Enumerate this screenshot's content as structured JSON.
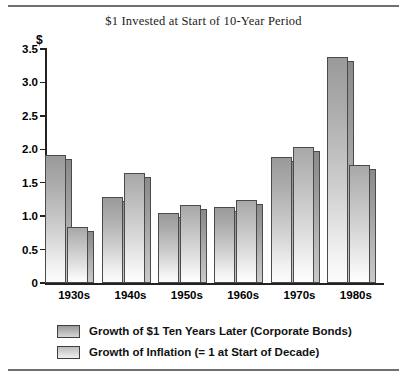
{
  "chart_data": {
    "type": "bar",
    "title": "$1 Invested at Start of 10-Year Period",
    "xlabel": "",
    "ylabel": "$",
    "ylim": [
      0,
      3.5
    ],
    "ytick_labels": [
      "0",
      "0.5",
      "1.0",
      "1.5",
      "2.0",
      "2.5",
      "3.0",
      "3.5"
    ],
    "ytick_values": [
      0,
      0.5,
      1.0,
      1.5,
      2.0,
      2.5,
      3.0,
      3.5
    ],
    "grid": false,
    "legend_position": "bottom-left",
    "categories": [
      "1930s",
      "1940s",
      "1950s",
      "1960s",
      "1970s",
      "1980s"
    ],
    "series": [
      {
        "name": "Growth of $1 Ten Years Later (Corporate Bonds)",
        "values": [
          1.91,
          1.29,
          1.04,
          1.13,
          1.88,
          3.38
        ]
      },
      {
        "name": "Growth of Inflation (= 1 at Start of Decade)",
        "values": [
          0.84,
          1.65,
          1.17,
          1.24,
          2.03,
          1.76
        ]
      }
    ]
  },
  "legend": {
    "items": [
      {
        "label": "Growth of $1 Ten Years Later (Corporate Bonds)"
      },
      {
        "label": "Growth of Inflation (= 1 at Start of Decade)"
      }
    ]
  }
}
